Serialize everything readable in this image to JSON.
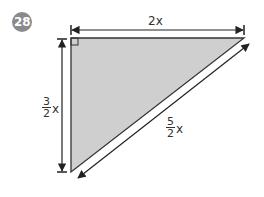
{
  "problem": {
    "number": "28",
    "badge_color": "#8a8a8a"
  },
  "triangle": {
    "fill": "#cfcfcf",
    "stroke": "#333333",
    "right_angle_marker": true
  },
  "labels": {
    "top": "2x",
    "left": {
      "numerator": "3",
      "denominator": "2",
      "variable": "x"
    },
    "hypotenuse": {
      "numerator": "5",
      "denominator": "2",
      "variable": "x"
    }
  }
}
